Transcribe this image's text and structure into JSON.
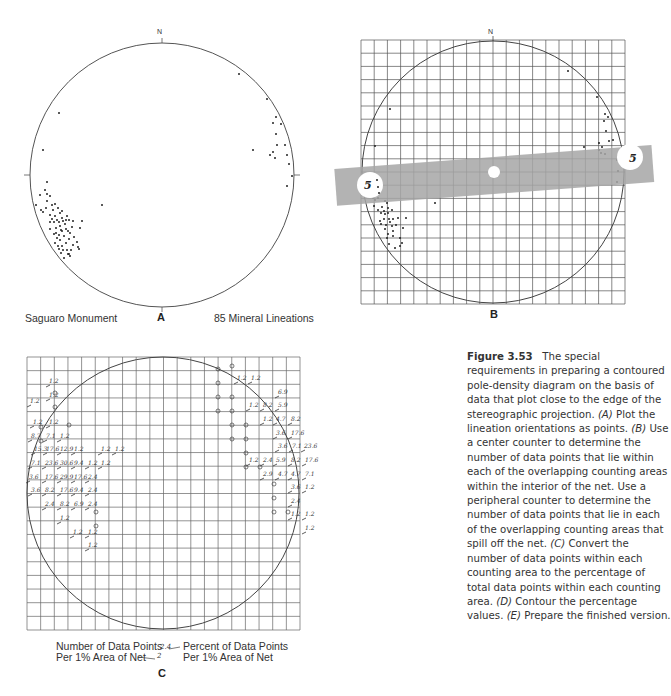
{
  "panels": {
    "a": {
      "letter": "A",
      "north_label": "N",
      "left_label": "Saguaro Monument",
      "right_label": "85 Mineral Lineations",
      "center": [
        162,
        175
      ],
      "radius": 132
    },
    "b": {
      "letter": "B",
      "north_label": "N",
      "counter_value_left": "5",
      "counter_value_right": "5",
      "grid": {
        "x0": 361,
        "y0": 40,
        "cols": 20,
        "rows": 20,
        "cell": 13.2
      },
      "center": [
        493,
        172
      ],
      "radius": 131,
      "counter_color": "#a6a6a6"
    },
    "c": {
      "letter": "C",
      "grid": {
        "x0": 27,
        "y0": 357,
        "cols": 20,
        "rows": 20,
        "cell": 13.65
      },
      "center": [
        163,
        493
      ],
      "radius": 136,
      "legend_left_line1": "Number of Data Points",
      "legend_left_line2": "Per 1% Area of Net",
      "legend_right_line1": "Percent of Data Points",
      "legend_right_line2": "Per 1% Area of Net",
      "legend_sample_value": "2.4",
      "legend_sample_count": "2"
    }
  },
  "caption": {
    "figure_label": "Figure 3.53",
    "text_1": "The special requirements in preparing a contoured pole-density diagram on the basis of data that plot close to the edge of the stereographic projection. ",
    "a_tag": "(A)",
    "text_a": " Plot the lineation orientations as points. ",
    "b_tag": "(B)",
    "text_b": " Use a center counter to determine the number of data points that lie within each of the overlapping counting areas within the interior of the net. Use a peripheral counter to determine the number of data points that lie in each of the overlapping counting areas that spill off the net. ",
    "c_tag": "(C)",
    "text_c": " Convert the number of data points within each counting area to the percentage of total data points within each counting area. ",
    "d_tag": "(D)",
    "text_d": " Contour the percentage values. ",
    "e_tag": "(E)",
    "text_e": " Prepare the finished version."
  },
  "points_a": [
    [
      239,
      74
    ],
    [
      59,
      113
    ],
    [
      43,
      150
    ],
    [
      267,
      99
    ],
    [
      276,
      117
    ],
    [
      273,
      123
    ],
    [
      277,
      145
    ],
    [
      276,
      134
    ],
    [
      285,
      145
    ],
    [
      281,
      124
    ],
    [
      253,
      150
    ],
    [
      270,
      155
    ],
    [
      273,
      152
    ],
    [
      275,
      158
    ],
    [
      287,
      155
    ],
    [
      289,
      164
    ],
    [
      292,
      176
    ],
    [
      287,
      186
    ],
    [
      47,
      182
    ],
    [
      40,
      195
    ],
    [
      47,
      194
    ],
    [
      36,
      205
    ],
    [
      50,
      196
    ],
    [
      41,
      210
    ],
    [
      43,
      212
    ],
    [
      47,
      201
    ],
    [
      52,
      205
    ],
    [
      55,
      204
    ],
    [
      58,
      208
    ],
    [
      53,
      210
    ],
    [
      60,
      213
    ],
    [
      62,
      211
    ],
    [
      50,
      215
    ],
    [
      55,
      216
    ],
    [
      57,
      220
    ],
    [
      62,
      218
    ],
    [
      67,
      216
    ],
    [
      50,
      222
    ],
    [
      54,
      222
    ],
    [
      59,
      222
    ],
    [
      63,
      221
    ],
    [
      69,
      220
    ],
    [
      73,
      221
    ],
    [
      82,
      221
    ],
    [
      50,
      229
    ],
    [
      56,
      228
    ],
    [
      61,
      230
    ],
    [
      66,
      229
    ],
    [
      80,
      228
    ],
    [
      54,
      234
    ],
    [
      59,
      235
    ],
    [
      64,
      236
    ],
    [
      70,
      233
    ],
    [
      74,
      237
    ],
    [
      57,
      238
    ],
    [
      60,
      240
    ],
    [
      69,
      239
    ],
    [
      55,
      243
    ],
    [
      58,
      246
    ],
    [
      66,
      243
    ],
    [
      73,
      245
    ],
    [
      59,
      249
    ],
    [
      63,
      250
    ],
    [
      67,
      250
    ],
    [
      78,
      247
    ],
    [
      79,
      249
    ],
    [
      61,
      253
    ],
    [
      69,
      254
    ],
    [
      71,
      250
    ],
    [
      64,
      258
    ],
    [
      70,
      256
    ],
    [
      68,
      254
    ],
    [
      102,
      205
    ],
    [
      56,
      233
    ],
    [
      52,
      219
    ],
    [
      60,
      226
    ],
    [
      65,
      224
    ],
    [
      62,
      231
    ],
    [
      68,
      231
    ],
    [
      72,
      227
    ],
    [
      66,
      220
    ],
    [
      46,
      208
    ],
    [
      45,
      190
    ],
    [
      77,
      242
    ],
    [
      62,
      246
    ]
  ],
  "points_b": [
    [
      568,
      71
    ],
    [
      390,
      109
    ],
    [
      375,
      146
    ],
    [
      597,
      97
    ],
    [
      605,
      114
    ],
    [
      608,
      117
    ],
    [
      604,
      121
    ],
    [
      606,
      131
    ],
    [
      584,
      147
    ],
    [
      599,
      143
    ],
    [
      602,
      147
    ],
    [
      599,
      150
    ],
    [
      601,
      153
    ],
    [
      605,
      154
    ],
    [
      609,
      141
    ],
    [
      613,
      140
    ],
    [
      617,
      160
    ],
    [
      618,
      171
    ],
    [
      617,
      182
    ],
    [
      377,
      180
    ],
    [
      378,
      187
    ],
    [
      379,
      193
    ],
    [
      373,
      198
    ],
    [
      375,
      200
    ],
    [
      378,
      198
    ],
    [
      385,
      201
    ],
    [
      387,
      203
    ],
    [
      382,
      207
    ],
    [
      388,
      208
    ],
    [
      384,
      211
    ],
    [
      374,
      206
    ],
    [
      378,
      210
    ],
    [
      381,
      213
    ],
    [
      385,
      214
    ],
    [
      388,
      213
    ],
    [
      392,
      210
    ],
    [
      384,
      219
    ],
    [
      389,
      219
    ],
    [
      393,
      219
    ],
    [
      398,
      218
    ],
    [
      381,
      224
    ],
    [
      386,
      225
    ],
    [
      392,
      226
    ],
    [
      396,
      225
    ],
    [
      385,
      229
    ],
    [
      388,
      234
    ],
    [
      393,
      231
    ],
    [
      387,
      238
    ],
    [
      393,
      236
    ],
    [
      400,
      238
    ],
    [
      389,
      244
    ],
    [
      402,
      243
    ],
    [
      395,
      248
    ],
    [
      400,
      246
    ],
    [
      435,
      203
    ],
    [
      406,
      218
    ],
    [
      380,
      221
    ],
    [
      390,
      222
    ],
    [
      403,
      228
    ]
  ],
  "annotations_c": [
    {
      "x": 48,
      "y": 376,
      "t": "1.2"
    },
    {
      "x": 48,
      "y": 390,
      "t": "1.2"
    },
    {
      "x": 29,
      "y": 396,
      "t": "1.2"
    },
    {
      "x": 32,
      "y": 417,
      "t": "1.2"
    },
    {
      "x": 48,
      "y": 417,
      "t": "1.2"
    },
    {
      "x": 30,
      "y": 431,
      "t": "8.7"
    },
    {
      "x": 45,
      "y": 431,
      "t": "7.1"
    },
    {
      "x": 59,
      "y": 431,
      "t": "1.2"
    },
    {
      "x": 33,
      "y": 444,
      "t": "15.3"
    },
    {
      "x": 45,
      "y": 444,
      "t": "17.6"
    },
    {
      "x": 59,
      "y": 444,
      "t": "12.9"
    },
    {
      "x": 73,
      "y": 444,
      "t": "1.2"
    },
    {
      "x": 100,
      "y": 444,
      "t": "1.2"
    },
    {
      "x": 114,
      "y": 444,
      "t": "1.2"
    },
    {
      "x": 30,
      "y": 458,
      "t": "7.1"
    },
    {
      "x": 44,
      "y": 458,
      "t": "23.6"
    },
    {
      "x": 59,
      "y": 458,
      "t": "30.6"
    },
    {
      "x": 73,
      "y": 458,
      "t": "9.4"
    },
    {
      "x": 87,
      "y": 458,
      "t": "1.2"
    },
    {
      "x": 100,
      "y": 458,
      "t": "1.2"
    },
    {
      "x": 28,
      "y": 472,
      "t": "3.6"
    },
    {
      "x": 44,
      "y": 472,
      "t": "17.6"
    },
    {
      "x": 59,
      "y": 472,
      "t": "29.9"
    },
    {
      "x": 73,
      "y": 472,
      "t": "17.6"
    },
    {
      "x": 87,
      "y": 472,
      "t": "2.4"
    },
    {
      "x": 30,
      "y": 485,
      "t": "3.6"
    },
    {
      "x": 44,
      "y": 485,
      "t": "8.2"
    },
    {
      "x": 59,
      "y": 485,
      "t": "17.6"
    },
    {
      "x": 73,
      "y": 485,
      "t": "9.4"
    },
    {
      "x": 87,
      "y": 485,
      "t": "2.4"
    },
    {
      "x": 44,
      "y": 499,
      "t": "2.4"
    },
    {
      "x": 59,
      "y": 499,
      "t": "8.2"
    },
    {
      "x": 73,
      "y": 499,
      "t": "6.9"
    },
    {
      "x": 87,
      "y": 499,
      "t": "2.4"
    },
    {
      "x": 59,
      "y": 513,
      "t": "1.2"
    },
    {
      "x": 72,
      "y": 527,
      "t": "1.2"
    },
    {
      "x": 87,
      "y": 527,
      "t": "1.2"
    },
    {
      "x": 87,
      "y": 540,
      "t": "1.2"
    },
    {
      "x": 236,
      "y": 373,
      "t": "1.2"
    },
    {
      "x": 250,
      "y": 373,
      "t": "1.2"
    },
    {
      "x": 277,
      "y": 387,
      "t": "6.9"
    },
    {
      "x": 248,
      "y": 400,
      "t": "1.2"
    },
    {
      "x": 262,
      "y": 400,
      "t": "8.2"
    },
    {
      "x": 277,
      "y": 400,
      "t": "5.9"
    },
    {
      "x": 262,
      "y": 414,
      "t": "1.2"
    },
    {
      "x": 275,
      "y": 414,
      "t": "4.7"
    },
    {
      "x": 290,
      "y": 414,
      "t": "8.2"
    },
    {
      "x": 275,
      "y": 428,
      "t": "3.6"
    },
    {
      "x": 290,
      "y": 428,
      "t": "17.6"
    },
    {
      "x": 277,
      "y": 441,
      "t": "3.6"
    },
    {
      "x": 291,
      "y": 441,
      "t": "7.1"
    },
    {
      "x": 303,
      "y": 441,
      "t": "23.6"
    },
    {
      "x": 248,
      "y": 455,
      "t": "1.2"
    },
    {
      "x": 262,
      "y": 455,
      "t": "2.4"
    },
    {
      "x": 275,
      "y": 455,
      "t": "5.9"
    },
    {
      "x": 290,
      "y": 455,
      "t": "8.2"
    },
    {
      "x": 304,
      "y": 455,
      "t": "17.6"
    },
    {
      "x": 262,
      "y": 469,
      "t": "2.9"
    },
    {
      "x": 277,
      "y": 469,
      "t": "4.7"
    },
    {
      "x": 290,
      "y": 469,
      "t": "4.7"
    },
    {
      "x": 304,
      "y": 469,
      "t": "7.1"
    },
    {
      "x": 290,
      "y": 482,
      "t": "3.6"
    },
    {
      "x": 304,
      "y": 482,
      "t": "1.2"
    },
    {
      "x": 290,
      "y": 496,
      "t": "2.4"
    },
    {
      "x": 290,
      "y": 509,
      "t": "1.2"
    },
    {
      "x": 304,
      "y": 509,
      "t": "1.2"
    },
    {
      "x": 304,
      "y": 523,
      "t": "1.2"
    }
  ]
}
